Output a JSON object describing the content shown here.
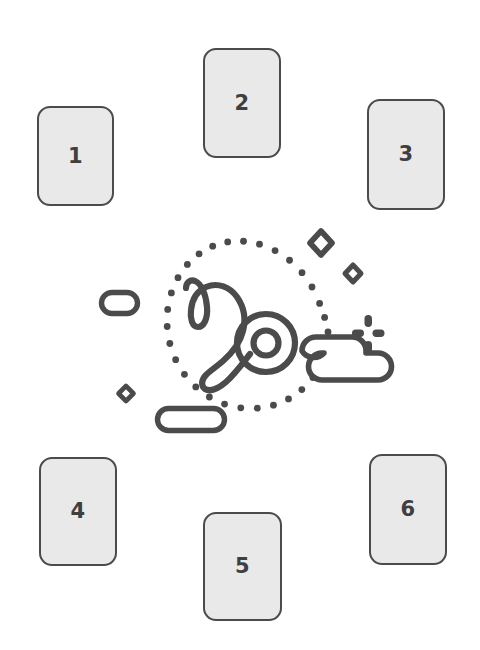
{
  "canvas": {
    "width": 480,
    "height": 650,
    "background": "#ffffff"
  },
  "theme": {
    "card_fill": "#e9e9e9",
    "stroke": "#4b4b4b",
    "number_color": "#3f3f3f",
    "art_stroke": "#4b4b4b"
  },
  "cards": [
    {
      "id": "card-1",
      "label": "1",
      "position": "top-left"
    },
    {
      "id": "card-2",
      "label": "2",
      "position": "top-center"
    },
    {
      "id": "card-3",
      "label": "3",
      "position": "top-right"
    },
    {
      "id": "card-4",
      "label": "4",
      "position": "bottom-left"
    },
    {
      "id": "card-5",
      "label": "5",
      "position": "bottom-center"
    },
    {
      "id": "card-6",
      "label": "6",
      "position": "bottom-right"
    }
  ],
  "center_art": {
    "zodiac_sign": "Capricorn",
    "glyph": "♑",
    "icon_names": [
      "capricorn-glyph-icon",
      "dotted-circle-icon",
      "diamond-large-icon",
      "diamond-medium-icon",
      "diamond-small-icon",
      "sparkle-icon",
      "pill-left-icon",
      "pill-bottom-icon",
      "cloud-icon"
    ]
  }
}
